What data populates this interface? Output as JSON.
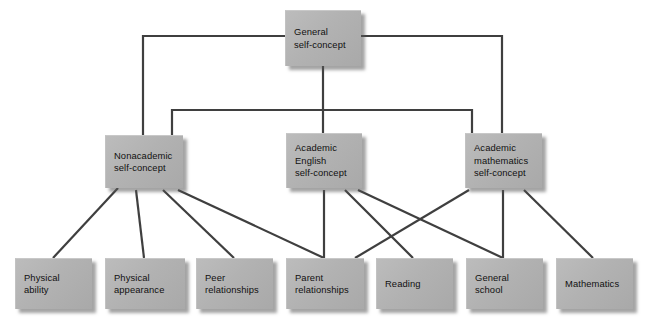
{
  "diagram": {
    "type": "hierarchy-tree",
    "canvas": {
      "width": 656,
      "height": 329
    },
    "style": {
      "box_fill": "#b3b3b3",
      "box_shadow": "#5a5a5a",
      "line_color": "#3f3f3f",
      "text_color": "#111111",
      "background": "#ffffff"
    },
    "levels": [
      {
        "name": "general",
        "label": "General self-concept"
      },
      {
        "name": "domain",
        "label": "Domain self-concepts"
      },
      {
        "name": "facet",
        "label": "Specific facets"
      }
    ],
    "nodes": [
      {
        "id": "general-self-concept",
        "level": "general",
        "lines": [
          "General",
          "self-concept"
        ],
        "x": 285,
        "y": 10,
        "w": 76,
        "h": 56
      },
      {
        "id": "nonacademic-self-concept",
        "level": "domain",
        "lines": [
          "Nonacademic",
          "self-concept"
        ],
        "x": 105,
        "y": 135,
        "w": 78,
        "h": 53
      },
      {
        "id": "academic-english-self-concept",
        "level": "domain",
        "lines": [
          "Academic",
          "English",
          "self-concept"
        ],
        "x": 286,
        "y": 133,
        "w": 76,
        "h": 55
      },
      {
        "id": "academic-mathematics-self-concept",
        "level": "domain",
        "lines": [
          "Academic",
          "mathematics",
          "self-concept"
        ],
        "x": 465,
        "y": 133,
        "w": 77,
        "h": 55
      },
      {
        "id": "physical-ability",
        "level": "facet",
        "lines": [
          "Physical",
          "ability"
        ],
        "x": 15,
        "y": 258,
        "w": 77,
        "h": 51
      },
      {
        "id": "physical-appearance",
        "level": "facet",
        "lines": [
          "Physical",
          "appearance"
        ],
        "x": 105,
        "y": 258,
        "w": 80,
        "h": 51
      },
      {
        "id": "peer-relationships",
        "level": "facet",
        "lines": [
          "Peer",
          "relationships"
        ],
        "x": 196,
        "y": 258,
        "w": 77,
        "h": 51
      },
      {
        "id": "parent-relationships",
        "level": "facet",
        "lines": [
          "Parent",
          "relationships"
        ],
        "x": 286,
        "y": 258,
        "w": 78,
        "h": 51
      },
      {
        "id": "reading",
        "level": "facet",
        "lines": [
          "Reading"
        ],
        "x": 376,
        "y": 258,
        "w": 77,
        "h": 51
      },
      {
        "id": "general-school",
        "level": "facet",
        "lines": [
          "General",
          "school"
        ],
        "x": 466,
        "y": 258,
        "w": 77,
        "h": 51
      },
      {
        "id": "mathematics",
        "level": "facet",
        "lines": [
          "Mathematics"
        ],
        "x": 556,
        "y": 258,
        "w": 77,
        "h": 51
      }
    ],
    "edges": [
      {
        "from": "general-self-concept",
        "to": "nonacademic-self-concept",
        "kind": "orthogonal-left"
      },
      {
        "from": "general-self-concept",
        "to": "academic-english-self-concept",
        "kind": "vertical"
      },
      {
        "from": "general-self-concept",
        "to": "academic-mathematics-self-concept",
        "kind": "orthogonal-right"
      },
      {
        "from": "nonacademic-self-concept",
        "to": "physical-ability",
        "kind": "diagonal"
      },
      {
        "from": "nonacademic-self-concept",
        "to": "physical-appearance",
        "kind": "diagonal"
      },
      {
        "from": "nonacademic-self-concept",
        "to": "peer-relationships",
        "kind": "vertical"
      },
      {
        "from": "nonacademic-self-concept",
        "to": "parent-relationships",
        "kind": "diagonal"
      },
      {
        "from": "academic-english-self-concept",
        "to": "parent-relationships",
        "kind": "vertical"
      },
      {
        "from": "academic-english-self-concept",
        "to": "reading",
        "kind": "diagonal"
      },
      {
        "from": "academic-english-self-concept",
        "to": "general-school",
        "kind": "diagonal"
      },
      {
        "from": "academic-mathematics-self-concept",
        "to": "reading",
        "kind": "diagonal"
      },
      {
        "from": "academic-mathematics-self-concept",
        "to": "general-school",
        "kind": "vertical"
      },
      {
        "from": "academic-mathematics-self-concept",
        "to": "mathematics",
        "kind": "diagonal"
      }
    ]
  }
}
